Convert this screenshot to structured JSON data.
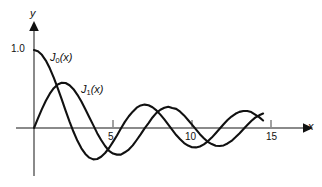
{
  "figure": {
    "background_color": "#ffffff",
    "ink_color": "#111111",
    "axis_color": "#8a8a8a"
  },
  "axes": {
    "x_axis_name": "x",
    "y_axis_name": "y",
    "x_ticks": [
      {
        "value": 5,
        "label": "5"
      },
      {
        "value": 10,
        "label": "10"
      },
      {
        "value": 15,
        "label": "15"
      }
    ],
    "y_ticks": [
      {
        "value": 1.0,
        "label": "1.0"
      }
    ]
  },
  "curves": [
    {
      "id": "J0",
      "label_fn": "J",
      "label_sub": "0",
      "label_arg": "(x)",
      "label_text": "J0(x)"
    },
    {
      "id": "J1",
      "label_fn": "J",
      "label_sub": "1",
      "label_arg": "(x)",
      "label_text": "J1(x)"
    }
  ],
  "chart_data": {
    "type": "line",
    "title": "",
    "xlabel": "x",
    "ylabel": "y",
    "xlim": [
      0,
      16.5
    ],
    "ylim": [
      -0.55,
      1.15
    ],
    "grid": false,
    "legend": "inline-curve-labels",
    "x": [
      0,
      0.25,
      0.5,
      0.75,
      1,
      1.25,
      1.5,
      1.75,
      2,
      2.25,
      2.5,
      2.75,
      3,
      3.25,
      3.5,
      3.75,
      4,
      4.25,
      4.5,
      4.75,
      5,
      5.25,
      5.5,
      5.75,
      6,
      6.25,
      6.5,
      6.75,
      7,
      7.25,
      7.5,
      7.75,
      8,
      8.25,
      8.5,
      8.75,
      9,
      9.25,
      9.5,
      9.75,
      10,
      10.25,
      10.5,
      10.75,
      11,
      11.25,
      11.5,
      11.75,
      12,
      12.25,
      12.5,
      12.75,
      13,
      13.25,
      13.5,
      13.75,
      14,
      14.25,
      14.5
    ],
    "series": [
      {
        "name": "J0(x)",
        "values": [
          1.0,
          0.9844,
          0.9385,
          0.8642,
          0.7652,
          0.6459,
          0.5118,
          0.369,
          0.2239,
          0.0827,
          -0.0484,
          -0.1641,
          -0.2601,
          -0.3325,
          -0.3801,
          -0.4026,
          -0.3971,
          -0.3686,
          -0.3205,
          -0.2566,
          -0.1776,
          -0.0968,
          -0.0068,
          0.0782,
          0.1506,
          0.2095,
          0.2601,
          0.2891,
          0.3001,
          0.2921,
          0.2663,
          0.2255,
          0.1717,
          0.1097,
          0.0419,
          -0.0251,
          -0.0903,
          -0.1449,
          -0.1939,
          -0.2255,
          -0.2459,
          -0.249,
          -0.2366,
          -0.2103,
          -0.1712,
          -0.123,
          -0.0677,
          -0.01,
          0.0477,
          0.1014,
          0.1469,
          0.1825,
          0.2069,
          0.2186,
          0.2178,
          0.2047,
          0.1711,
          0.1389,
          0.096
        ]
      },
      {
        "name": "J1(x)",
        "values": [
          0.0,
          0.124,
          0.2423,
          0.3492,
          0.4401,
          0.5106,
          0.5579,
          0.5802,
          0.5767,
          0.5484,
          0.4971,
          0.4256,
          0.3391,
          0.2403,
          0.1374,
          0.0366,
          -0.066,
          -0.1538,
          -0.2311,
          -0.2943,
          -0.3276,
          -0.3414,
          -0.3414,
          -0.311,
          -0.2767,
          -0.2231,
          -0.1538,
          -0.0826,
          -0.0047,
          0.0627,
          0.1352,
          0.1947,
          0.2346,
          0.2587,
          0.2731,
          0.2566,
          0.2453,
          0.2098,
          0.1613,
          0.1031,
          0.0435,
          -0.0184,
          -0.0789,
          -0.1301,
          -0.1768,
          -0.2062,
          -0.2284,
          -0.2309,
          -0.2234,
          -0.1983,
          -0.1655,
          -0.1196,
          -0.0703,
          -0.0152,
          0.038,
          0.0898,
          0.1334,
          0.1628,
          0.1856
        ]
      }
    ]
  }
}
